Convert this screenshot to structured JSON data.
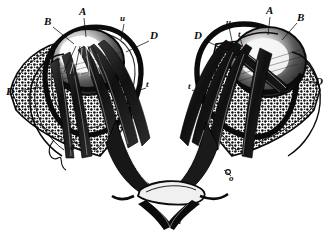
{
  "figure": {
    "medium": "engraving",
    "palette": {
      "background": "#ffffff",
      "ink": "#0b0b0b",
      "midtone": "#6e6e6e",
      "highlight": "#f2f2f2"
    },
    "width": 329,
    "height": 235
  },
  "labels": [
    {
      "id": "l-b-left",
      "text": "B",
      "case": "cap",
      "x": 44,
      "y": 16,
      "leader": {
        "x1": 53,
        "y1": 27,
        "x2": 74,
        "y2": 44
      }
    },
    {
      "id": "l-a-left",
      "text": "A",
      "case": "cap",
      "x": 79,
      "y": 6,
      "leader": {
        "x1": 84,
        "y1": 18,
        "x2": 86,
        "y2": 37
      }
    },
    {
      "id": "l-u-left",
      "text": "u",
      "case": "min",
      "x": 120,
      "y": 14,
      "leader": {
        "x1": 124,
        "y1": 24,
        "x2": 121,
        "y2": 40
      }
    },
    {
      "id": "l-d-left-inner",
      "text": "D",
      "case": "cap",
      "x": 150,
      "y": 30,
      "leader": {
        "x1": 149,
        "y1": 41,
        "x2": 126,
        "y2": 52
      }
    },
    {
      "id": "l-d-left-outer",
      "text": "D",
      "case": "cap",
      "x": 6,
      "y": 86,
      "leader": {
        "x1": 18,
        "y1": 91,
        "x2": 47,
        "y2": 86
      }
    },
    {
      "id": "l-t-left",
      "text": "t",
      "case": "min",
      "x": 146,
      "y": 80,
      "leader": {
        "x1": 146,
        "y1": 88,
        "x2": 134,
        "y2": 92
      }
    },
    {
      "id": "l-a-lower",
      "text": "a",
      "case": "min",
      "x": 70,
      "y": 143,
      "leader": {
        "x1": 74,
        "y1": 143,
        "x2": 78,
        "y2": 131
      }
    },
    {
      "id": "l-d-right-inner",
      "text": "D",
      "case": "cap",
      "x": 194,
      "y": 30,
      "leader": {
        "x1": 204,
        "y1": 40,
        "x2": 226,
        "y2": 50
      }
    },
    {
      "id": "l-u-right",
      "text": "u",
      "case": "min",
      "x": 226,
      "y": 18,
      "leader": {
        "x1": 229,
        "y1": 27,
        "x2": 232,
        "y2": 41
      }
    },
    {
      "id": "l-t-right-top",
      "text": "t",
      "case": "min",
      "x": 238,
      "y": 30,
      "leader": {
        "x1": 240,
        "y1": 38,
        "x2": 244,
        "y2": 50
      }
    },
    {
      "id": "l-a-right",
      "text": "A",
      "case": "cap",
      "x": 266,
      "y": 5,
      "leader": {
        "x1": 270,
        "y1": 17,
        "x2": 268,
        "y2": 35
      }
    },
    {
      "id": "l-b-right",
      "text": "B",
      "case": "cap",
      "x": 297,
      "y": 12,
      "leader": {
        "x1": 297,
        "y1": 23,
        "x2": 282,
        "y2": 40
      }
    },
    {
      "id": "l-d-right-outer",
      "text": "D",
      "case": "cap",
      "x": 315,
      "y": 76,
      "leader": {
        "x1": 314,
        "y1": 82,
        "x2": 293,
        "y2": 78
      }
    },
    {
      "id": "l-t-right-low",
      "text": "t",
      "case": "min",
      "x": 188,
      "y": 82,
      "leader": {
        "x1": 192,
        "y1": 90,
        "x2": 200,
        "y2": 94
      }
    },
    {
      "id": "l-o-right",
      "text": "o",
      "case": "min",
      "x": 229,
      "y": 174,
      "leader": {
        "x1": 231,
        "y1": 176,
        "x2": 224,
        "y2": 170
      }
    },
    {
      "id": "l-m-bottom",
      "text": "m",
      "case": "min",
      "x": 174,
      "y": 217,
      "leader": null
    }
  ],
  "structures": [
    {
      "name": "left-eyeball",
      "label_refs": [
        "A",
        "B"
      ]
    },
    {
      "name": "right-eyeball",
      "label_refs": [
        "A",
        "B"
      ]
    },
    {
      "name": "left-orbital-bone",
      "label_refs": [
        "D"
      ]
    },
    {
      "name": "right-orbital-bone",
      "label_refs": [
        "D"
      ]
    },
    {
      "name": "left-optic-nerve",
      "label_refs": [
        "t"
      ]
    },
    {
      "name": "right-optic-nerve",
      "label_refs": [
        "t"
      ]
    },
    {
      "name": "optic-chiasm",
      "label_refs": [
        "m"
      ]
    },
    {
      "name": "extraocular-muscles",
      "label_refs": [
        "u",
        "a",
        "o"
      ]
    }
  ]
}
